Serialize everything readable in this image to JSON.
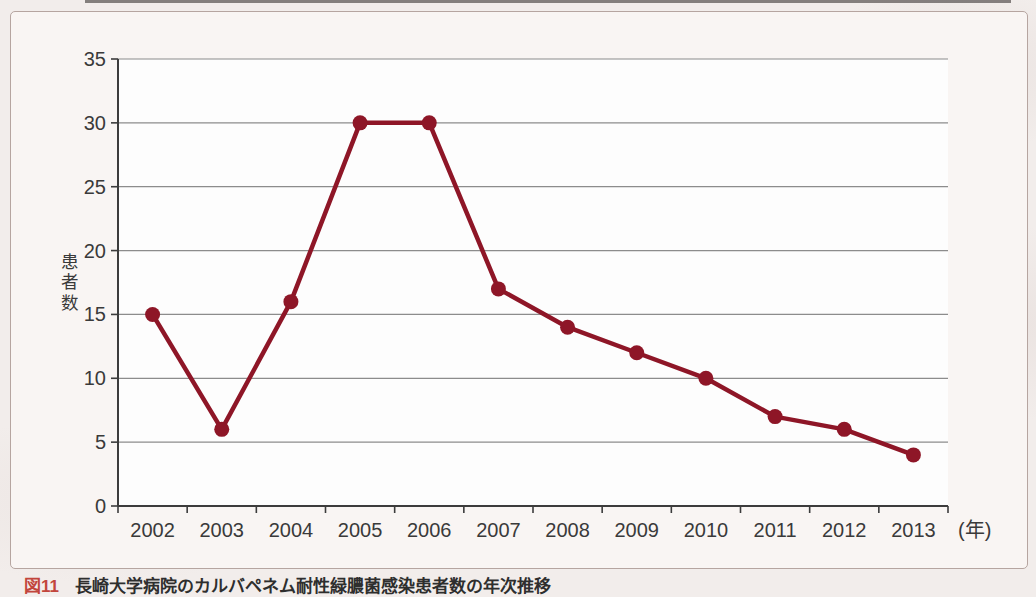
{
  "figure": {
    "caption": {
      "label": "図11",
      "title": "長崎大学病院のカルバペネム耐性緑膿菌感染患者数の年次推移"
    }
  },
  "chart_data": {
    "type": "line",
    "categories": [
      "2002",
      "2003",
      "2004",
      "2005",
      "2006",
      "2007",
      "2008",
      "2009",
      "2010",
      "2011",
      "2012",
      "2013"
    ],
    "series": [
      {
        "name": "患者数",
        "values": [
          15,
          6,
          16,
          30,
          30,
          17,
          14,
          12,
          10,
          7,
          6,
          4
        ]
      }
    ],
    "title": "",
    "xlabel": "",
    "x_unit_label": "(年)",
    "ylabel": "患者数",
    "ylim": [
      0,
      35
    ],
    "ytick_step": 5,
    "grid": true,
    "legend": "none",
    "line_color": "#8e1627",
    "marker": "circle",
    "colors": {
      "gridline": "#8c8c8c",
      "axis": "#3c3c3c",
      "plot_background": "#fdfdfd"
    }
  }
}
